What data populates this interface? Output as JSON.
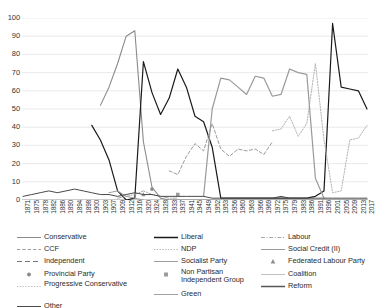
{
  "chart_data": {
    "type": "line",
    "title": "",
    "xlabel": "",
    "ylabel": "",
    "ylim": [
      0,
      100
    ],
    "ytick_step": 10,
    "grid": true,
    "legend_position": "bottom",
    "yticks": [
      "100",
      "90",
      "80",
      "70",
      "60",
      "50",
      "40",
      "30",
      "20",
      "10",
      "0"
    ],
    "categories": [
      "1871",
      "1875",
      "1878",
      "1882",
      "1886",
      "1890",
      "1894",
      "1898",
      "1900",
      "1903",
      "1907",
      "1909",
      "1912",
      "1916",
      "1920",
      "1924",
      "1928",
      "1933",
      "1937",
      "1941",
      "1945",
      "1949",
      "1952",
      "1953",
      "1956",
      "1960",
      "1963",
      "1966",
      "1969",
      "1972",
      "1975",
      "1979",
      "1983",
      "1986",
      "1991",
      "1996",
      "2001",
      "2005",
      "2009",
      "2013",
      "2017"
    ],
    "series": [
      {
        "name": "Conservative",
        "color": "#8a8a8a",
        "style": "solid",
        "width": 1.1,
        "values": [
          null,
          null,
          null,
          null,
          null,
          null,
          null,
          null,
          null,
          52,
          62,
          75,
          90,
          93,
          32,
          7,
          1,
          0,
          0,
          0,
          0,
          0,
          0,
          0,
          0,
          0,
          0,
          0,
          0,
          0,
          0,
          0,
          0,
          0,
          0,
          0,
          0,
          0,
          0,
          0,
          0
        ]
      },
      {
        "name": "Liberal",
        "color": "#1a1a1a",
        "style": "solid",
        "width": 1.2,
        "values": [
          null,
          null,
          null,
          null,
          null,
          null,
          null,
          null,
          41,
          33,
          22,
          5,
          0,
          1,
          76,
          59,
          47,
          56,
          72,
          62,
          46,
          43,
          29,
          1,
          1,
          1,
          1,
          1,
          1,
          1,
          1,
          1,
          1,
          1,
          2,
          5,
          97,
          62,
          61,
          60,
          50
        ]
      },
      {
        "name": "CCF",
        "color": "#9b9b9b",
        "style": "dashed",
        "width": 1.0,
        "values": [
          null,
          null,
          null,
          null,
          null,
          null,
          null,
          null,
          null,
          null,
          null,
          null,
          null,
          null,
          null,
          null,
          null,
          16,
          14,
          24,
          31,
          27,
          42,
          28,
          24,
          28,
          27,
          28,
          25,
          32,
          null,
          null,
          null,
          null,
          null,
          null,
          null,
          null,
          null,
          null,
          null
        ]
      },
      {
        "name": "NDP",
        "color": "#b3b3b3",
        "style": "dotted",
        "width": 1.0,
        "values": [
          null,
          null,
          null,
          null,
          null,
          null,
          null,
          null,
          null,
          null,
          null,
          null,
          null,
          null,
          null,
          null,
          null,
          null,
          null,
          null,
          null,
          null,
          null,
          null,
          null,
          null,
          null,
          null,
          null,
          38,
          39,
          46,
          35,
          42,
          75,
          33,
          4,
          5,
          33,
          34,
          41
        ]
      },
      {
        "name": "Labour",
        "color": "#a8a8a8",
        "style": "dash-dot",
        "width": 1.0,
        "values": [
          null,
          null,
          null,
          null,
          null,
          null,
          null,
          null,
          null,
          null,
          null,
          1,
          2,
          3,
          5,
          3,
          2,
          1,
          1,
          null,
          null,
          null,
          null,
          null,
          null,
          null,
          null,
          null,
          null,
          null,
          null,
          null,
          null,
          null,
          null,
          null,
          null,
          null,
          null,
          null,
          null
        ]
      },
      {
        "name": "Independent",
        "color": "#777777",
        "style": "long-dash",
        "width": 1.0,
        "values": [
          null,
          null,
          null,
          null,
          null,
          null,
          null,
          null,
          null,
          null,
          null,
          null,
          null,
          null,
          null,
          null,
          null,
          null,
          null,
          null,
          null,
          null,
          null,
          null,
          null,
          null,
          null,
          null,
          null,
          null,
          null,
          null,
          null,
          null,
          null,
          null,
          null,
          null,
          null,
          null,
          null
        ]
      },
      {
        "name": "Socialist Party",
        "color": "#9e9e9e",
        "style": "solid",
        "width": 1.0,
        "values": [
          null,
          null,
          null,
          null,
          null,
          null,
          null,
          null,
          null,
          null,
          4,
          5,
          2,
          1,
          0,
          null,
          null,
          null,
          null,
          null,
          null,
          null,
          null,
          null,
          null,
          null,
          null,
          null,
          null,
          null,
          null,
          null,
          null,
          null,
          null,
          null,
          null,
          null,
          null,
          null,
          null
        ]
      },
      {
        "name": "Social Credit (II)",
        "color": "#9a9a9a",
        "style": "solid",
        "width": 1.2,
        "values": [
          null,
          null,
          null,
          null,
          null,
          null,
          null,
          null,
          null,
          null,
          null,
          null,
          null,
          null,
          null,
          null,
          null,
          null,
          null,
          null,
          null,
          2,
          50,
          67,
          66,
          62,
          58,
          68,
          67,
          57,
          58,
          72,
          70,
          69,
          12,
          1,
          null,
          null,
          null,
          null,
          null
        ]
      },
      {
        "name": "Provincial Party",
        "color": "#8c8c8c",
        "style": "marker-circle",
        "width": 1.0,
        "values": [
          null,
          null,
          null,
          null,
          null,
          null,
          null,
          null,
          null,
          null,
          null,
          null,
          null,
          null,
          null,
          6,
          null,
          null,
          null,
          null,
          null,
          null,
          null,
          null,
          null,
          null,
          null,
          null,
          null,
          null,
          null,
          null,
          null,
          null,
          null,
          null,
          null,
          null,
          null,
          null,
          null
        ]
      },
      {
        "name": "Non Partisan Independent Group",
        "color": "#9c9c9c",
        "style": "marker-square",
        "width": 1.0,
        "values": [
          null,
          null,
          null,
          null,
          null,
          null,
          null,
          null,
          null,
          null,
          null,
          null,
          null,
          null,
          null,
          null,
          null,
          null,
          3,
          null,
          null,
          null,
          null,
          null,
          null,
          null,
          null,
          null,
          null,
          null,
          null,
          null,
          null,
          null,
          null,
          null,
          null,
          null,
          null,
          null,
          null
        ]
      },
      {
        "name": "Federated Labour Party",
        "color": "#8f8f8f",
        "style": "marker-triangle",
        "width": 1.0,
        "values": [
          null,
          null,
          null,
          null,
          null,
          null,
          null,
          null,
          null,
          null,
          null,
          null,
          null,
          null,
          3,
          null,
          null,
          null,
          null,
          null,
          null,
          null,
          null,
          null,
          null,
          null,
          null,
          null,
          null,
          null,
          null,
          null,
          null,
          null,
          null,
          null,
          null,
          null,
          null,
          null,
          null
        ]
      },
      {
        "name": "Progressive Conservative",
        "color": "#bdbdbd",
        "style": "dotted",
        "width": 1.0,
        "values": [
          null,
          null,
          null,
          null,
          null,
          null,
          null,
          null,
          null,
          null,
          null,
          null,
          null,
          null,
          null,
          null,
          null,
          null,
          null,
          null,
          null,
          null,
          null,
          null,
          null,
          null,
          null,
          null,
          null,
          null,
          null,
          null,
          null,
          null,
          null,
          null,
          null,
          null,
          null,
          null,
          null
        ]
      },
      {
        "name": "Coalition",
        "color": "#c2c2c2",
        "style": "solid",
        "width": 1.0,
        "values": [
          null,
          null,
          null,
          null,
          null,
          null,
          null,
          null,
          null,
          null,
          null,
          null,
          null,
          null,
          null,
          null,
          null,
          null,
          null,
          null,
          null,
          null,
          null,
          null,
          null,
          null,
          null,
          null,
          null,
          null,
          null,
          null,
          null,
          null,
          null,
          null,
          null,
          null,
          null,
          null,
          null
        ]
      },
      {
        "name": "Other",
        "color": "#4a4a4a",
        "style": "solid",
        "width": 1.0,
        "values": [
          2,
          3,
          4,
          5,
          4,
          5,
          6,
          5,
          4,
          3,
          3,
          2,
          3,
          4,
          3,
          3,
          2,
          2,
          2,
          2,
          2,
          2,
          1,
          1,
          1,
          1,
          1,
          1,
          1,
          1,
          2,
          1,
          1,
          1,
          1,
          1,
          1,
          1,
          1,
          1,
          1
        ]
      },
      {
        "name": "Reform",
        "color": "#555555",
        "style": "solid",
        "width": 1.1,
        "values": [
          null,
          null,
          null,
          null,
          null,
          null,
          null,
          null,
          null,
          null,
          null,
          null,
          null,
          null,
          null,
          null,
          null,
          null,
          null,
          null,
          null,
          null,
          null,
          null,
          null,
          null,
          null,
          null,
          null,
          null,
          null,
          null,
          null,
          null,
          null,
          null,
          null,
          null,
          null,
          null,
          null
        ]
      },
      {
        "name": "Green",
        "color": "#a0a0a0",
        "style": "solid",
        "width": 1.0,
        "values": [
          null,
          null,
          null,
          null,
          null,
          null,
          null,
          null,
          null,
          null,
          null,
          null,
          null,
          null,
          null,
          null,
          null,
          null,
          null,
          null,
          null,
          null,
          null,
          null,
          null,
          null,
          null,
          null,
          null,
          null,
          null,
          null,
          null,
          null,
          null,
          null,
          null,
          null,
          null,
          null,
          null
        ]
      }
    ]
  },
  "legend": {
    "columns": [
      [
        {
          "label": "Conservative",
          "key": "solid",
          "color": "#8a8a8a"
        },
        {
          "label": "CCF",
          "key": "dashed",
          "color": "#9b9b9b"
        },
        {
          "label": "Independent",
          "key": "long-dash",
          "color": "#777777"
        },
        {
          "label": "Provincial Party",
          "key": "marker-circle",
          "color": "#8c8c8c"
        },
        {
          "label": "Progressive Conservative",
          "key": "dotted",
          "color": "#bdbdbd"
        },
        {
          "label": "Other",
          "key": "solid",
          "color": "#4a4a4a"
        }
      ],
      [
        {
          "label": "Liberal",
          "key": "solid-bold",
          "color": "#1a1a1a"
        },
        {
          "label": "NDP",
          "key": "dotted",
          "color": "#b3b3b3"
        },
        {
          "label": "Socialist Party",
          "key": "solid",
          "color": "#9e9e9e"
        },
        {
          "label": "Non Partisan Independent Group",
          "key": "marker-square",
          "color": "#9c9c9c"
        },
        {
          "label": "Green",
          "key": "solid",
          "color": "#a0a0a0"
        }
      ],
      [
        {
          "label": "Labour",
          "key": "dash-dot",
          "color": "#a8a8a8"
        },
        {
          "label": "Social Credit (II)",
          "key": "solid",
          "color": "#9a9a9a"
        },
        {
          "label": "Federated Labour Party",
          "key": "marker-triangle",
          "color": "#8f8f8f"
        },
        {
          "label": "Coalition",
          "key": "solid",
          "color": "#c2c2c2"
        },
        {
          "label": "Reform",
          "key": "solid-bold",
          "color": "#555555"
        }
      ]
    ]
  }
}
